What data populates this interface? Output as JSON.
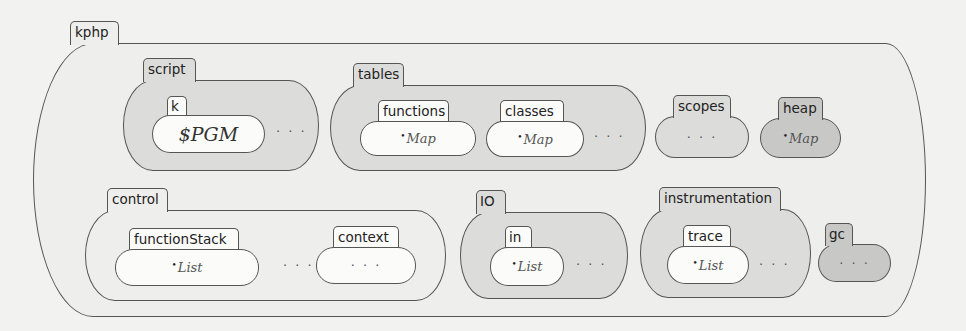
{
  "diagram": {
    "type": "K configuration",
    "root": {
      "name": "kphp",
      "cells": [
        {
          "name": "script",
          "children": [
            {
              "name": "k",
              "content": "$PGM"
            }
          ],
          "ellipsis": "..."
        },
        {
          "name": "tables",
          "children": [
            {
              "name": "functions",
              "content": "Map"
            },
            {
              "name": "classes",
              "content": "Map"
            }
          ],
          "ellipsis": "..."
        },
        {
          "name": "scopes",
          "content": "..."
        },
        {
          "name": "heap",
          "content": "Map"
        },
        {
          "name": "control",
          "children": [
            {
              "name": "functionStack",
              "content": "List"
            },
            {
              "name": "context",
              "content": "..."
            }
          ],
          "ellipsis": "..."
        },
        {
          "name": "IO",
          "children": [
            {
              "name": "in",
              "content": "List"
            }
          ],
          "ellipsis": "..."
        },
        {
          "name": "instrumentation",
          "children": [
            {
              "name": "trace",
              "content": "List"
            }
          ],
          "ellipsis": "..."
        },
        {
          "name": "gc",
          "content": "..."
        }
      ]
    }
  },
  "labels": {
    "kphp": "kphp",
    "script": "script",
    "k": "k",
    "k_content": "$PGM",
    "tables": "tables",
    "functions": "functions",
    "functions_content": "Map",
    "classes": "classes",
    "classes_content": "Map",
    "scopes": "scopes",
    "heap": "heap",
    "heap_content": "Map",
    "control": "control",
    "functionStack": "functionStack",
    "functionStack_content": "List",
    "context": "context",
    "IO": "IO",
    "in": "in",
    "in_content": "List",
    "instrumentation": "instrumentation",
    "trace": "trace",
    "trace_content": "List",
    "gc": "gc",
    "ellipsis": "· · ·",
    "bullet": "•"
  },
  "colors": {
    "background": "#f2f2f0",
    "border": "#555555",
    "white_cell": "#fbfbfa",
    "light_cell": "#eeeeec",
    "mid_cell": "#dcdcda",
    "dark_cell": "#c8c8c6"
  }
}
